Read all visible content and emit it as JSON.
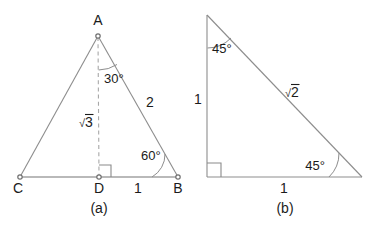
{
  "figures": [
    {
      "id": "figure-a",
      "caption": "(a)",
      "type": "30-60-90 right triangle with altitude",
      "vertices": [
        {
          "name": "A",
          "label": "A",
          "x": 98,
          "y": 36
        },
        {
          "name": "C",
          "label": "C",
          "x": 20,
          "y": 177
        },
        {
          "name": "D",
          "label": "D",
          "x": 99,
          "y": 177
        },
        {
          "name": "B",
          "label": "B",
          "x": 178,
          "y": 177
        }
      ],
      "angles": [
        {
          "name": "angle-DAB",
          "label": "30°",
          "value": 30,
          "at": "A"
        },
        {
          "name": "angle-ABD",
          "label": "60°",
          "value": 60,
          "at": "B"
        },
        {
          "name": "angle-ADB",
          "label": "right-angle",
          "value": 90,
          "at": "D"
        }
      ],
      "side_labels": [
        {
          "name": "side-AB",
          "radical": true,
          "sign": "√",
          "text": "2",
          "plain": "2"
        },
        {
          "name": "side-AD",
          "radical": true,
          "sign": "√",
          "text": "3",
          "plain": "√3"
        },
        {
          "name": "side-DB",
          "radical": false,
          "sign": "",
          "text": "1",
          "plain": "1"
        }
      ]
    },
    {
      "id": "figure-b",
      "caption": "(b)",
      "type": "45-45-90 right triangle",
      "vertices": [
        {
          "name": "top-vertex",
          "label": "",
          "x": 207,
          "y": 15
        },
        {
          "name": "right-angle-vertex",
          "label": "",
          "x": 207,
          "y": 177
        },
        {
          "name": "bottom-right-vertex",
          "label": "",
          "x": 362,
          "y": 177
        }
      ],
      "angles": [
        {
          "name": "angle-top",
          "label": "45°",
          "value": 45
        },
        {
          "name": "angle-bottom-right",
          "label": "45°",
          "value": 45
        },
        {
          "name": "angle-corner",
          "label": "right-angle",
          "value": 90
        }
      ],
      "side_labels": [
        {
          "name": "side-vertical",
          "radical": false,
          "sign": "",
          "text": "1",
          "plain": "1"
        },
        {
          "name": "side-horizontal",
          "radical": false,
          "sign": "",
          "text": "1",
          "plain": "1"
        },
        {
          "name": "side-hypotenuse",
          "radical": true,
          "sign": "√",
          "text": "2",
          "plain": "√2"
        }
      ]
    }
  ],
  "labels": {
    "a_vertex_A": "A",
    "a_vertex_C": "C",
    "a_vertex_D": "D",
    "a_vertex_B": "B",
    "a_angle_30": "30°",
    "a_angle_60": "60°",
    "a_side_2": "2",
    "a_side_sqrt3_sign": "√",
    "a_side_sqrt3_num": "3",
    "a_side_1": "1",
    "a_caption": "(a)",
    "b_angle_top_45": "45°",
    "b_angle_bottom_45": "45°",
    "b_side_vertical_1": "1",
    "b_side_horizontal_1": "1",
    "b_side_sqrt2_sign": "√",
    "b_side_sqrt2_num": "2",
    "b_caption": "(b)"
  },
  "colors": {
    "background": "#ffffff",
    "line": "#8d8d8d",
    "base_line": "#a2a2a2",
    "dashed_line": "#a8a8a8",
    "text": "#1b1b1b"
  }
}
